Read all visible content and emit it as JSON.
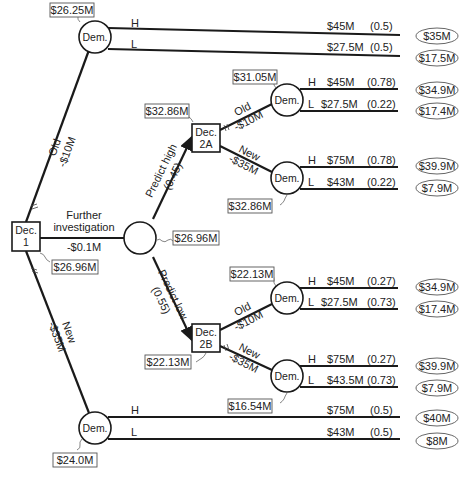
{
  "diagram": {
    "type": "decision-tree",
    "nodes": {
      "dec1": {
        "label_line1": "Dec.",
        "label_line2": "1",
        "value": "$26.96M"
      },
      "dem_top": {
        "label": "Dem.",
        "value": "$26.25M"
      },
      "chance_invest": {
        "value": "$26.96M"
      },
      "dec2a": {
        "label_line1": "Dec.",
        "label_line2": "2A",
        "value": "$32.86M"
      },
      "dec2b": {
        "label_line1": "Dec.",
        "label_line2": "2B",
        "value": "$22.13M"
      },
      "dem_2a_old": {
        "label": "Dem.",
        "value": "$31.05M"
      },
      "dem_2a_new": {
        "label": "Dem.",
        "value": "$32.86M"
      },
      "dem_2b_old": {
        "label": "Dem.",
        "value": "$22.13M"
      },
      "dem_2b_new": {
        "label": "Dem.",
        "value": "$16.54M"
      },
      "dem_bottom": {
        "label": "Dem.",
        "value": "$24.0M"
      }
    },
    "edges": {
      "old": {
        "label": "Old",
        "cost": "-$10M"
      },
      "further": {
        "label_line1": "Further",
        "label_line2": "investigation",
        "cost": "-$0.1M"
      },
      "new": {
        "label": "New",
        "cost": "-$35M"
      },
      "predict_high": {
        "label": "Predict high",
        "prob": "(0.45)"
      },
      "predict_low": {
        "label": "Predict low",
        "prob": "(0.55)"
      },
      "a_old": {
        "label": "Old",
        "cost": "-$10M"
      },
      "a_new": {
        "label": "New",
        "cost": "-$35M"
      },
      "b_old": {
        "label": "Old",
        "cost": "-$10M"
      },
      "b_new": {
        "label": "New",
        "cost": "-$35M"
      }
    },
    "branches": {
      "top_h": {
        "label": "H",
        "payoff": "$45M",
        "prob": "(0.5)",
        "outcome": "$35M"
      },
      "top_l": {
        "label": "L",
        "payoff": "$27.5M",
        "prob": "(0.5)",
        "outcome": "$17.5M"
      },
      "a_old_h": {
        "label": "H",
        "payoff": "$45M",
        "prob": "(0.78)",
        "outcome": "$34.9M"
      },
      "a_old_l": {
        "label": "L",
        "payoff": "$27.5M",
        "prob": "(0.22)",
        "outcome": "$17.4M"
      },
      "a_new_h": {
        "label": "H",
        "payoff": "$75M",
        "prob": "(0.78)",
        "outcome": "$39.9M"
      },
      "a_new_l": {
        "label": "L",
        "payoff": "$43M",
        "prob": "(0.22)",
        "outcome": "$7.9M"
      },
      "b_old_h": {
        "label": "H",
        "payoff": "$45M",
        "prob": "(0.27)",
        "outcome": "$34.9M"
      },
      "b_old_l": {
        "label": "L",
        "payoff": "$27.5M",
        "prob": "(0.73)",
        "outcome": "$17.4M"
      },
      "b_new_h": {
        "label": "H",
        "payoff": "$75M",
        "prob": "(0.27)",
        "outcome": "$39.9M"
      },
      "b_new_l": {
        "label": "L",
        "payoff": "$43.5M",
        "prob": "(0.73)",
        "outcome": "$7.9M"
      },
      "bot_h": {
        "label": "H",
        "payoff": "$75M",
        "prob": "(0.5)",
        "outcome": "$40M"
      },
      "bot_l": {
        "label": "L",
        "payoff": "$43M",
        "prob": "(0.5)",
        "outcome": "$8M"
      }
    }
  }
}
